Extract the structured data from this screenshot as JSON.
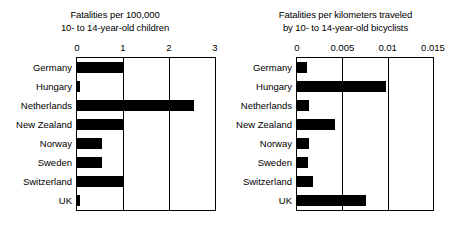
{
  "figure": {
    "background": "#ffffff",
    "bar_color": "#000000",
    "axis_color": "#000000"
  },
  "categories": [
    "Germany",
    "Hungary",
    "Netherlands",
    "New Zealand",
    "Norway",
    "Sweden",
    "Switzerland",
    "UK"
  ],
  "chart_data": [
    {
      "type": "bar",
      "orientation": "horizontal",
      "title": "Fatalities per 100,000 10- to 14-year-old children",
      "title_lines": [
        "Fatalities per 100,000",
        "10- to 14-year-old children"
      ],
      "categories": [
        "Germany",
        "Hungary",
        "Netherlands",
        "New Zealand",
        "Norway",
        "Sweden",
        "Switzerland",
        "UK"
      ],
      "values": [
        1.0,
        0.06,
        2.55,
        1.0,
        0.54,
        0.55,
        1.0,
        0.06
      ],
      "xlabel": "",
      "ylabel": "",
      "xlim": [
        0,
        3
      ],
      "ticks": [
        0,
        1,
        2,
        3
      ],
      "tick_labels": [
        "0",
        "1",
        "2",
        "3"
      ],
      "grid": true,
      "legend": "none"
    },
    {
      "type": "bar",
      "orientation": "horizontal",
      "title": "Fatalities per kilometers traveled by 10- to 14-year-old bicyclists",
      "title_lines": [
        "Fatalities per kilometers traveled",
        "by 10- to 14-year-old bicyclists"
      ],
      "categories": [
        "Germany",
        "Hungary",
        "Netherlands",
        "New Zealand",
        "Norway",
        "Sweden",
        "Switzerland",
        "UK"
      ],
      "values": [
        0.0011,
        0.0098,
        0.0013,
        0.0042,
        0.0013,
        0.0012,
        0.0018,
        0.0076
      ],
      "xlabel": "",
      "ylabel": "",
      "xlim": [
        0,
        0.015
      ],
      "ticks": [
        0,
        0.005,
        0.01,
        0.015
      ],
      "tick_labels": [
        "0",
        "0.005",
        "0.01",
        "0.015"
      ],
      "grid": true,
      "legend": "none"
    }
  ]
}
